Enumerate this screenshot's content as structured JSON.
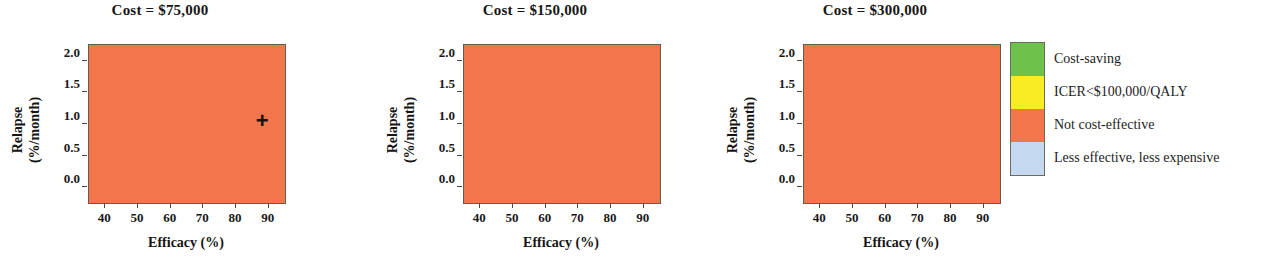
{
  "chart_data": {
    "type": "heatmap",
    "title": "",
    "xlabel": "Efficacy (%)",
    "ylabel": "Relapse (%/month)",
    "xlim": [
      35,
      95
    ],
    "ylim": [
      2.25,
      -0.25
    ],
    "xticks": [
      "40",
      "50",
      "60",
      "70",
      "80",
      "90"
    ],
    "xtick_values": [
      40,
      50,
      60,
      70,
      80,
      90
    ],
    "yticks": [
      "0.0",
      "0.5",
      "1.0",
      "1.5",
      "2.0"
    ],
    "ytick_values": [
      0.0,
      0.5,
      1.0,
      1.5,
      2.0
    ],
    "grid": false,
    "legend_position": "right",
    "colors": {
      "cost_saving": "#6cc24a",
      "icer_under_100k": "#f9ec22",
      "not_cost_effective": "#f3764a",
      "less_effective_less_expensive": "#c4d8f0"
    },
    "panels": [
      {
        "id": "panel-1",
        "title": "Cost = $75,000",
        "marker": {
          "label": "+",
          "x": 88,
          "y": 1.05
        },
        "regions": [
          {
            "category": "less_effective_less_expensive",
            "x0": 35,
            "x1": 95,
            "y0": -0.25,
            "y1": 2.25
          },
          {
            "category": "cost_saving",
            "x0": 55,
            "x1": 95,
            "y0": -0.25,
            "y1": 0.25
          },
          {
            "category": "cost_saving",
            "x0": 75,
            "x1": 95,
            "y0": 0.25,
            "y1": 0.75
          },
          {
            "category": "not_cost_effective",
            "x0": 35,
            "x1": 55,
            "y0": 0.75,
            "y1": 2.25
          },
          {
            "category": "not_cost_effective",
            "x0": 55,
            "x1": 65,
            "y0": 1.25,
            "y1": 2.25
          },
          {
            "category": "not_cost_effective",
            "x0": 65,
            "x1": 85,
            "y0": 1.75,
            "y1": 2.25
          }
        ]
      },
      {
        "id": "panel-2",
        "title": "Cost = $150,000",
        "marker": null,
        "regions": [
          {
            "category": "not_cost_effective",
            "x0": 35,
            "x1": 95,
            "y0": -0.25,
            "y1": 2.25
          },
          {
            "category": "less_effective_less_expensive",
            "x0": 45,
            "x1": 55,
            "y0": -0.25,
            "y1": 0.25
          },
          {
            "category": "cost_saving",
            "x0": 55,
            "x1": 95,
            "y0": -0.25,
            "y1": 0.25
          },
          {
            "category": "cost_saving",
            "x0": 75,
            "x1": 95,
            "y0": 0.25,
            "y1": 0.75
          }
        ]
      },
      {
        "id": "panel-3",
        "title": "Cost = $300,000",
        "marker": null,
        "regions": [
          {
            "category": "not_cost_effective",
            "x0": 35,
            "x1": 95,
            "y0": -0.25,
            "y1": 2.25
          },
          {
            "category": "icer_under_100k",
            "x0": 85,
            "x1": 95,
            "y0": -0.25,
            "y1": 0.25
          }
        ]
      }
    ],
    "legend": [
      {
        "category": "cost_saving",
        "label": "Cost-saving",
        "color": "#6cc24a"
      },
      {
        "category": "icer_under_100k",
        "label": "ICER<$100,000/QALY",
        "color": "#f9ec22"
      },
      {
        "category": "not_cost_effective",
        "label": "Not cost-effective",
        "color": "#f3764a"
      },
      {
        "category": "less_effective_less_expensive",
        "label": "Less effective, less expensive",
        "color": "#c4d8f0"
      }
    ]
  },
  "layout": {
    "panel_lefts": [
      0,
      375,
      715
    ],
    "panel_width": 320,
    "plot": {
      "left": 88,
      "top": 44,
      "width": 196,
      "height": 158
    }
  }
}
